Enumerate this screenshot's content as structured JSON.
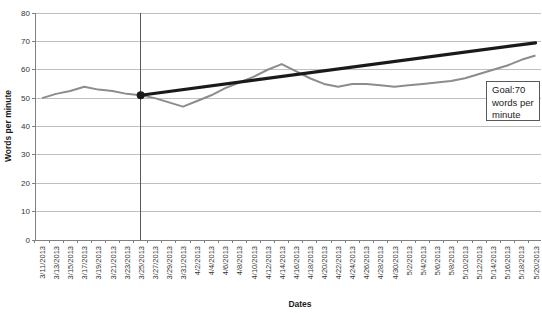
{
  "colors": {
    "background": "#ffffff",
    "grid": "#bfbfbf",
    "axis": "#808080",
    "marker_line": "#595959",
    "data_line": "#8c8c8c",
    "goal_line": "#1a1a1a",
    "text": "#333333",
    "annotation_border": "#595959"
  },
  "chart_data": {
    "type": "line",
    "title": "",
    "xlabel": "Dates",
    "ylabel": "Words per minute",
    "ylim": [
      0,
      80
    ],
    "ytick_interval": 10,
    "yticks": [
      0,
      10,
      20,
      30,
      40,
      50,
      60,
      70,
      80
    ],
    "grid": true,
    "legend": "none",
    "categories": [
      "3/11/2013",
      "3/13/2013",
      "3/15/2013",
      "3/17/2013",
      "3/19/2013",
      "3/21/2013",
      "3/23/2013",
      "3/25/2013",
      "3/27/2013",
      "3/29/2013",
      "3/31/2013",
      "4/2/2013",
      "4/4/2013",
      "4/6/2013",
      "4/8/2013",
      "4/10/2013",
      "4/12/2013",
      "4/14/2013",
      "4/16/2013",
      "4/18/2013",
      "4/20/2013",
      "4/22/2013",
      "4/24/2013",
      "4/26/2013",
      "4/28/2013",
      "4/30/2013",
      "5/2/2013",
      "5/4/2013",
      "5/6/2013",
      "5/8/2013",
      "5/10/2013",
      "5/12/2013",
      "5/14/2013",
      "5/16/2013",
      "5/18/2013",
      "5/20/2013"
    ],
    "series": [
      {
        "name": "Words per minute (actual)",
        "color": "#8c8c8c",
        "stroke_width": 2,
        "values": [
          50,
          51.5,
          52.5,
          54,
          53,
          52.5,
          51.5,
          51,
          50,
          48.5,
          47,
          49,
          51,
          53.5,
          55.5,
          57.5,
          60,
          62,
          59.5,
          57,
          55,
          54,
          55,
          55,
          54.5,
          54,
          54.5,
          55,
          55.5,
          56,
          57,
          58.5,
          60,
          61.5,
          63.5,
          65
        ]
      },
      {
        "name": "Goal trend line",
        "color": "#1a1a1a",
        "stroke_width": 3.2,
        "start_marker": true,
        "points": [
          {
            "x": "3/25/2013",
            "value": 51
          },
          {
            "x": "5/20/2013",
            "value": 69.5
          }
        ]
      }
    ],
    "vertical_marker": {
      "x": "3/25/2013"
    },
    "annotation": {
      "text": "Goal:70 words per minute",
      "lines": [
        "Goal:70",
        "words per",
        "minute"
      ],
      "goal_value": 70
    }
  }
}
